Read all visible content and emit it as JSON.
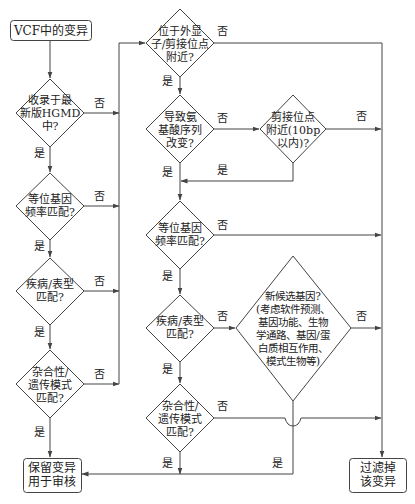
{
  "diagram": {
    "type": "flowchart",
    "stroke_color": "#444444",
    "nodes": {
      "start": {
        "label": "VCF中的变异",
        "shape": "rounded-rect"
      },
      "left_hgmd": {
        "label": "收录于最\n新版HGMD\n中?",
        "shape": "diamond"
      },
      "left_allele_freq": {
        "label": "等位基因\n频率匹配?",
        "shape": "diamond"
      },
      "left_phenotype": {
        "label": "疾病/表型\n匹配?",
        "shape": "diamond"
      },
      "left_zygosity": {
        "label": "杂合性/\n遗传模式\n匹配?",
        "shape": "diamond"
      },
      "mid_exon_splice": {
        "label": "位于外显\n子/剪接位点\n附近?",
        "shape": "diamond"
      },
      "mid_aa_change": {
        "label": "导致氨\n基酸序列\n改变?",
        "shape": "diamond"
      },
      "splice_10bp": {
        "label": "剪接位点\n附近(10bp\n以内)?",
        "shape": "diamond"
      },
      "mid_allele_freq": {
        "label": "等位基因\n频率匹配?",
        "shape": "diamond"
      },
      "mid_phenotype": {
        "label": "疾病/表型\n匹配?",
        "shape": "diamond"
      },
      "candidate_gene": {
        "label": "新候选基因?\n(考虑软件预测、\n基因功能、生物\n学通路、基因/蛋\n白质相互作用、\n模式生物等)",
        "shape": "diamond"
      },
      "mid_zygosity": {
        "label": "杂合性/\n遗传模式\n匹配?",
        "shape": "diamond"
      },
      "keep": {
        "label": "保留变异\n用于审核",
        "shape": "rounded-rect"
      },
      "filter": {
        "label": "过滤掉\n该变异",
        "shape": "rounded-rect"
      }
    },
    "edge_labels": {
      "yes": "是",
      "no": "否"
    },
    "edges": [
      {
        "from": "start",
        "to": "left_hgmd",
        "label": ""
      },
      {
        "from": "left_hgmd",
        "to": "left_allele_freq",
        "label": "是"
      },
      {
        "from": "left_hgmd",
        "to": "mid_exon_splice",
        "label": "否"
      },
      {
        "from": "left_allele_freq",
        "to": "left_phenotype",
        "label": "是"
      },
      {
        "from": "left_allele_freq",
        "to": "mid_exon_splice",
        "label": "否"
      },
      {
        "from": "left_phenotype",
        "to": "left_zygosity",
        "label": "是"
      },
      {
        "from": "left_phenotype",
        "to": "mid_exon_splice",
        "label": "否"
      },
      {
        "from": "left_zygosity",
        "to": "keep",
        "label": "是"
      },
      {
        "from": "left_zygosity",
        "to": "mid_exon_splice",
        "label": "否"
      },
      {
        "from": "mid_exon_splice",
        "to": "mid_aa_change",
        "label": "是"
      },
      {
        "from": "mid_exon_splice",
        "to": "filter",
        "label": "否"
      },
      {
        "from": "mid_aa_change",
        "to": "mid_allele_freq",
        "label": "是"
      },
      {
        "from": "mid_aa_change",
        "to": "splice_10bp",
        "label": "否"
      },
      {
        "from": "splice_10bp",
        "to": "mid_allele_freq",
        "label": "是"
      },
      {
        "from": "splice_10bp",
        "to": "filter",
        "label": "否"
      },
      {
        "from": "mid_allele_freq",
        "to": "mid_phenotype",
        "label": "是"
      },
      {
        "from": "mid_allele_freq",
        "to": "filter",
        "label": "否"
      },
      {
        "from": "mid_phenotype",
        "to": "mid_zygosity",
        "label": "是"
      },
      {
        "from": "mid_phenotype",
        "to": "candidate_gene",
        "label": "否"
      },
      {
        "from": "candidate_gene",
        "to": "keep",
        "label": "是"
      },
      {
        "from": "candidate_gene",
        "to": "filter",
        "label": "否"
      },
      {
        "from": "mid_zygosity",
        "to": "keep",
        "label": "是"
      },
      {
        "from": "mid_zygosity",
        "to": "filter",
        "label": "否"
      }
    ]
  }
}
